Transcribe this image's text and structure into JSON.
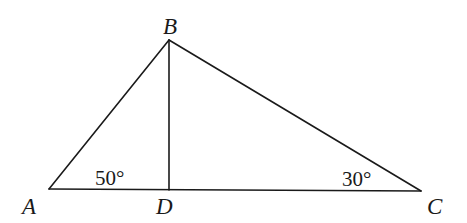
{
  "figure": {
    "type": "triangle-with-altitude",
    "vertices": {
      "A": {
        "label": "A",
        "x": 49,
        "y": 189
      },
      "B": {
        "label": "B",
        "x": 169,
        "y": 40
      },
      "C": {
        "label": "C",
        "x": 421,
        "y": 191
      },
      "D": {
        "label": "D",
        "x": 169,
        "y": 190
      }
    },
    "segments": [
      {
        "name": "AB",
        "from": "A",
        "to": "B"
      },
      {
        "name": "BC",
        "from": "B",
        "to": "C"
      },
      {
        "name": "AC",
        "from": "A",
        "to": "C"
      },
      {
        "name": "BD",
        "from": "B",
        "to": "D"
      }
    ],
    "angles": {
      "A": {
        "label": "50°",
        "value": 50
      },
      "C": {
        "label": "30°",
        "value": 30
      }
    },
    "stroke_color": "#1a1a1a",
    "background_color": "#ffffff"
  }
}
